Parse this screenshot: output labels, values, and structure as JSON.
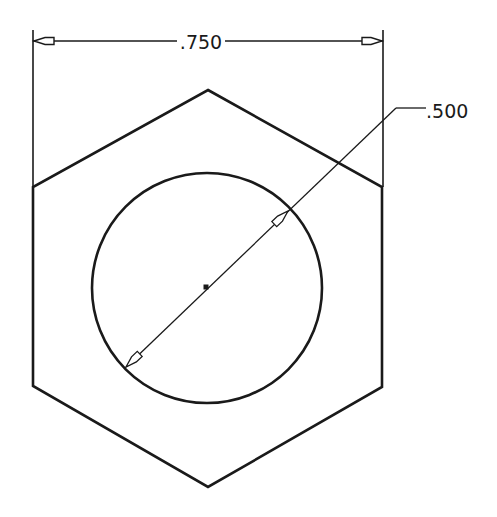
{
  "drawing": {
    "type": "technical-drawing",
    "subject": "hexagon with circular hole",
    "colors": {
      "line": "#1a1a1a",
      "background": "#ffffff"
    },
    "dimensions": {
      "width_across_flats": {
        "label": ".750",
        "value": 0.75,
        "orientation": "horizontal"
      },
      "hole_diameter": {
        "label": ".500",
        "value": 0.5,
        "orientation": "diagonal-leader"
      }
    },
    "geometry": {
      "hexagon": {
        "vertices": [
          [
            208,
            90
          ],
          [
            382,
            187
          ],
          [
            382,
            387
          ],
          [
            208,
            487
          ],
          [
            33,
            386
          ],
          [
            33,
            187
          ]
        ]
      },
      "circle": {
        "cx": 207,
        "cy": 288,
        "r": 115
      },
      "center_mark": {
        "x": 206,
        "y": 287
      }
    }
  }
}
